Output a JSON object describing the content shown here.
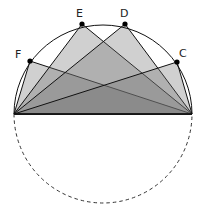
{
  "figure": {
    "center": [
      103,
      114
    ],
    "radius": 89,
    "diameter": {
      "a": [
        14,
        114
      ],
      "b": [
        192,
        114
      ]
    },
    "fill_color": "#6e6e6e",
    "fill_opacity": 0.32,
    "points": [
      {
        "label": "F",
        "x": 30,
        "y": 61,
        "lx": 15,
        "ly": 58
      },
      {
        "label": "E",
        "x": 82,
        "y": 24,
        "lx": 76,
        "ly": 17
      },
      {
        "label": "D",
        "x": 125,
        "y": 24,
        "lx": 120,
        "ly": 17
      },
      {
        "label": "C",
        "x": 177,
        "y": 62,
        "lx": 179,
        "ly": 57
      }
    ]
  }
}
